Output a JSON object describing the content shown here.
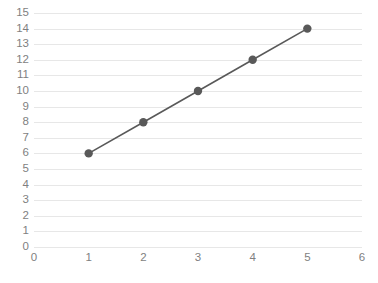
{
  "chart_data": {
    "type": "line",
    "title": "",
    "subtitle": "",
    "xlabel": "",
    "ylabel": "",
    "x": [
      1,
      2,
      3,
      4,
      5
    ],
    "values": [
      6,
      8,
      10,
      12,
      14
    ],
    "series": [
      {
        "name": "",
        "x": [
          1,
          2,
          3,
          4,
          5
        ],
        "values": [
          6,
          8,
          10,
          12,
          14
        ]
      }
    ],
    "xlim": [
      0,
      6
    ],
    "ylim": [
      0,
      15
    ],
    "x_ticks": [
      0,
      1,
      2,
      3,
      4,
      5,
      6
    ],
    "y_ticks": [
      0,
      1,
      2,
      3,
      4,
      5,
      6,
      7,
      8,
      9,
      10,
      11,
      12,
      13,
      14,
      15
    ],
    "x_tick_labels": [
      "0",
      "1",
      "2",
      "3",
      "4",
      "5",
      "6"
    ],
    "y_tick_labels": [
      "0",
      "1",
      "2",
      "3",
      "4",
      "5",
      "6",
      "7",
      "8",
      "9",
      "10",
      "11",
      "12",
      "13",
      "14",
      "15"
    ],
    "grid": {
      "horizontal": true,
      "vertical": false
    },
    "legend": {
      "visible": false,
      "position": "none",
      "entries": []
    },
    "annotations": [],
    "markers": {
      "shape": "circle",
      "radius": 4.2
    },
    "colors": {
      "line": "#595959",
      "marker": "#595959",
      "gridline": "#e7e7e7",
      "tick_label": "#7f7f7f",
      "background": "#ffffff"
    },
    "line_width": 1.6
  }
}
